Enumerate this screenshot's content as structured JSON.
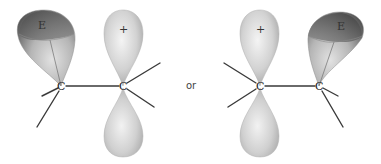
{
  "figure": {
    "connector_label": "or",
    "colors": {
      "p_orbital_light": "#f2f2f2",
      "p_orbital_mid": "#c8c8c8",
      "p_orbital_dark": "#9a9a9a",
      "e_orbital_light": "#d9d9d9",
      "e_orbital_dark": "#5a5a5a",
      "bond": "#3a3a3a"
    }
  },
  "left_structure": {
    "carbon_left": {
      "label": "C"
    },
    "carbon_right": {
      "label": "C"
    },
    "e_lobe": {
      "label": "E",
      "attached_to": "carbon_left"
    },
    "p_orbital_upper": {
      "label": "+",
      "attached_to": "carbon_right"
    },
    "p_orbital_lower": {
      "label": "",
      "attached_to": "carbon_right"
    }
  },
  "right_structure": {
    "carbon_left": {
      "label": "C"
    },
    "carbon_right": {
      "label": "C"
    },
    "p_orbital_upper": {
      "label": "+",
      "attached_to": "carbon_left"
    },
    "p_orbital_lower": {
      "label": "",
      "attached_to": "carbon_left"
    },
    "e_lobe": {
      "label": "E",
      "attached_to": "carbon_right"
    }
  }
}
